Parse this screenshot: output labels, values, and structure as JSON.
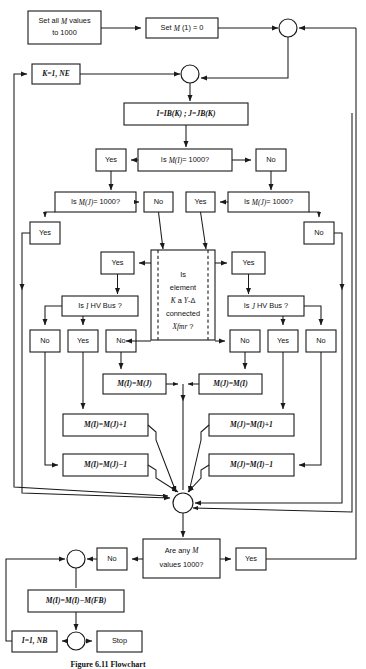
{
  "figure": {
    "caption": "Figure 6.11  Flowchart",
    "width": 366,
    "height": 669,
    "line_color": "#1a1a1a",
    "background": "#ffffff"
  },
  "nodes": {
    "set_all": "Set all M values to 1000",
    "set_m1": "Set M (1) = 0",
    "k_loop": "K=1, NE",
    "ib_jb": "I=IB(K) ; J=JB(K)",
    "is_mi_1000": "Is M(I) = 1000?",
    "yes_1": "Yes",
    "no_1": "No",
    "is_mj_1000_left": "Is M(J) = 1000?",
    "is_mj_1000_right": "Is M(J) = 1000?",
    "yes_l2": "Yes",
    "no_l2": "No",
    "yes_r2": "Yes",
    "no_r2": "No",
    "yes_l3": "Yes",
    "yes_r3": "Yes",
    "center_q_line1": "Is",
    "center_q_line2": "element",
    "center_q_line3": "K a Y-Δ",
    "center_q_line4": "connected",
    "center_q_line5": "Xfmr ?",
    "is_i_hv": "Is I HV Bus ?",
    "is_j_hv": "Is J HV Bus ?",
    "no_a": "No",
    "yes_b": "Yes",
    "no_c": "No",
    "no_d": "No",
    "yes_e": "Yes",
    "no_f": "No",
    "mi_eq_mj": "M(I)=M(J)",
    "mj_eq_mi": "M(J)=M(I)",
    "mi_eq_mj_p1": "M(I)=M(J)+1",
    "mj_eq_mi_p1": "M(J)=M(I)+1",
    "mi_eq_mj_m1": "M(I)=M(J)−1",
    "mj_eq_mi_m1": "M(J)=M(I)−1",
    "are_any_line1": "Are any M",
    "are_any_line2": "values 1000?",
    "no_final": "No",
    "yes_final": "Yes",
    "mi_fb": "M(I)=M(I)−M(FB)",
    "i_1_nb": "I=1, NB",
    "stop": "Stop"
  }
}
